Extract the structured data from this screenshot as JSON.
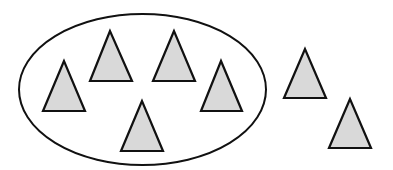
{
  "diagram": {
    "width": 393,
    "height": 170,
    "background": "#ffffff",
    "stroke_color": "#111111",
    "fill_color": "#d9d9d9",
    "set": {
      "shape": "ellipse",
      "cx": 142.5,
      "cy": 89.5,
      "rx": 123.5,
      "ry": 75.5,
      "count_inside": 5
    },
    "triangles": [
      {
        "id": "inside-1",
        "inside": true,
        "apex": [
          64,
          61
        ],
        "base_left": [
          43,
          111
        ],
        "base_right": [
          85,
          111
        ]
      },
      {
        "id": "inside-2",
        "inside": true,
        "apex": [
          110,
          31
        ],
        "base_left": [
          90,
          81
        ],
        "base_right": [
          132,
          81
        ]
      },
      {
        "id": "inside-3",
        "inside": true,
        "apex": [
          174,
          31
        ],
        "base_left": [
          153,
          81
        ],
        "base_right": [
          195,
          81
        ]
      },
      {
        "id": "inside-4",
        "inside": true,
        "apex": [
          221,
          61
        ],
        "base_left": [
          201,
          111
        ],
        "base_right": [
          242,
          111
        ]
      },
      {
        "id": "inside-5",
        "inside": true,
        "apex": [
          142,
          101
        ],
        "base_left": [
          121,
          151
        ],
        "base_right": [
          163,
          151
        ]
      },
      {
        "id": "outside-1",
        "inside": false,
        "apex": [
          305,
          49
        ],
        "base_left": [
          284,
          98
        ],
        "base_right": [
          326,
          98
        ]
      },
      {
        "id": "outside-2",
        "inside": false,
        "apex": [
          350,
          99
        ],
        "base_left": [
          329,
          148
        ],
        "base_right": [
          371,
          148
        ]
      }
    ],
    "count_outside": 2,
    "count_total": 7
  }
}
